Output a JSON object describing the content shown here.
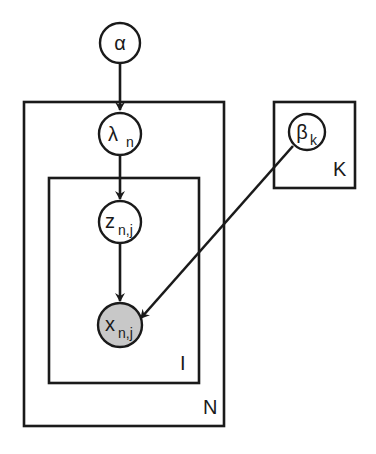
{
  "diagram": {
    "type": "plate-notation graphical model",
    "nodes": [
      {
        "id": "alpha",
        "symbol": "α",
        "subscript": "",
        "observed": false
      },
      {
        "id": "lambda",
        "symbol": "λ",
        "subscript": "n",
        "observed": false
      },
      {
        "id": "z",
        "symbol": "z",
        "subscript": "n,j",
        "observed": false
      },
      {
        "id": "x",
        "symbol": "x",
        "subscript": "n,j",
        "observed": true
      },
      {
        "id": "beta",
        "symbol": "β",
        "subscript": "k",
        "observed": false
      }
    ],
    "edges": [
      {
        "from": "alpha",
        "to": "lambda"
      },
      {
        "from": "lambda",
        "to": "z"
      },
      {
        "from": "z",
        "to": "x"
      },
      {
        "from": "beta",
        "to": "x"
      }
    ],
    "plates": [
      {
        "id": "N",
        "label": "N",
        "contains": [
          "lambda",
          "z",
          "x"
        ]
      },
      {
        "id": "I",
        "label": "I",
        "contains": [
          "z",
          "x"
        ]
      },
      {
        "id": "K",
        "label": "K",
        "contains": [
          "beta"
        ]
      }
    ],
    "colors": {
      "stroke": "#1a1a1a",
      "observed_fill": "#c8c8c8",
      "latent_fill": "#ffffff"
    }
  }
}
